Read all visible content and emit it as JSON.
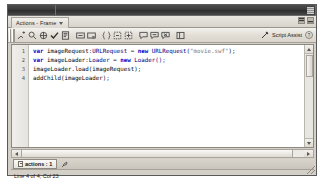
{
  "window": {
    "title_bar_segments": [
      "",
      ""
    ],
    "grip_icon": "window-grip-icon"
  },
  "panel": {
    "tab_label": "Actions - Frame",
    "tab_caret_icon": "chevron-down-icon",
    "controls": [
      {
        "name": "panel-menu-button",
        "glyph": "▮"
      },
      {
        "name": "panel-collapse-button",
        "glyph": "▬"
      }
    ]
  },
  "toolbar": {
    "grip_name": "toolbar-grip",
    "buttons": [
      {
        "name": "add-statement-icon",
        "glyph": "plus-script"
      },
      {
        "name": "find-icon",
        "glyph": "magnifier"
      },
      {
        "name": "insert-target-path-icon",
        "glyph": "target"
      },
      {
        "name": "check-syntax-icon",
        "glyph": "check"
      },
      {
        "name": "auto-format-icon",
        "glyph": "format-lines"
      },
      {
        "name": "show-code-hint-icon",
        "glyph": "code-hint"
      },
      {
        "name": "debug-options-icon",
        "glyph": "debug-breakpoint"
      },
      {
        "name": "collapse-between-braces-icon",
        "glyph": "collapse-braces"
      },
      {
        "name": "collapse-selection-icon",
        "glyph": "collapse-selection"
      },
      {
        "name": "expand-all-icon",
        "glyph": "expand-all"
      },
      {
        "name": "apply-block-comment-icon",
        "glyph": "comment-block"
      },
      {
        "name": "apply-line-comment-icon",
        "glyph": "comment-line"
      },
      {
        "name": "remove-comment-icon",
        "glyph": "comment-remove"
      },
      {
        "name": "show-hide-toolbox-icon",
        "glyph": "panel-toggle"
      }
    ],
    "script_assist_label": "Script Assist",
    "script_assist_icon": "script-assist-wand-icon",
    "help_label": "?",
    "help_icon": "help-icon"
  },
  "editor": {
    "line_numbers": [
      "1",
      "2",
      "3",
      "4"
    ],
    "lines": [
      {
        "tokens": [
          {
            "t": "var ",
            "c": "kw"
          },
          {
            "t": "imageRequest:",
            "c": ""
          },
          {
            "t": "URLRequest",
            "c": "cls"
          },
          {
            "t": " = ",
            "c": ""
          },
          {
            "t": "new ",
            "c": "kw"
          },
          {
            "t": "URLRequest(",
            "c": "cls"
          },
          {
            "t": "\"movie.swf\"",
            "c": "str"
          },
          {
            "t": ");",
            "c": ""
          }
        ]
      },
      {
        "tokens": [
          {
            "t": "var ",
            "c": "kw"
          },
          {
            "t": "imageLoader:",
            "c": ""
          },
          {
            "t": "Loader",
            "c": "cls"
          },
          {
            "t": " = ",
            "c": ""
          },
          {
            "t": "new ",
            "c": "kw"
          },
          {
            "t": "Loader();",
            "c": "cls"
          }
        ]
      },
      {
        "tokens": [
          {
            "t": "imageLoader.load(imageRequest);",
            "c": ""
          }
        ]
      },
      {
        "tokens": [
          {
            "t": "addChild(imageLoader);",
            "c": ""
          }
        ]
      }
    ],
    "vscrollbar": {
      "up_icon": "scroll-up-arrow-icon",
      "down_icon": "scroll-down-arrow-icon",
      "thumb_name": "vertical-scroll-thumb"
    },
    "hscrollbar": {
      "left_icon": "scroll-left-arrow-icon",
      "right_icon": "scroll-right-arrow-icon",
      "thumb_name": "horizontal-scroll-thumb"
    }
  },
  "script_tabs": {
    "items": [
      {
        "label": "actions : 1",
        "icon": "script-page-icon"
      }
    ],
    "pin_icon": "pin-script-icon"
  },
  "status": {
    "text": "Line 4 of 4, Col 23"
  },
  "resize_grip_icon": "resize-grip-icon"
}
